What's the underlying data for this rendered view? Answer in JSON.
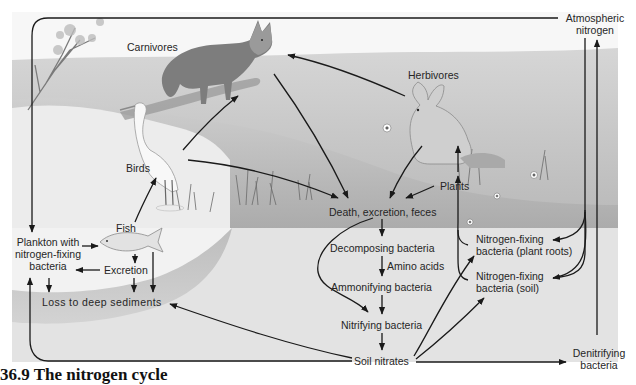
{
  "figure": {
    "caption": "36.9  The nitrogen cycle",
    "colors": {
      "upper_land": "#c9c9c9",
      "lower_land": "#bdbdbd",
      "water": "#eeeeee",
      "soil": "#e2e2e2",
      "sediment": "#c4c4c4",
      "arrow": "#1a1a1a",
      "text": "#262626"
    }
  },
  "labels": {
    "atmospheric_nitrogen": [
      "Atmospheric",
      "nitrogen"
    ],
    "carnivores": "Carnivores",
    "herbivores": "Herbivores",
    "birds": "Birds",
    "fish": "Fish",
    "plants": "Plants",
    "plankton": [
      "Plankton with",
      "nitrogen-fixing",
      "bacteria"
    ],
    "excretion": "Excretion",
    "loss_to_sediments": "Loss to deep sediments",
    "death_excretion_feces": "Death, excretion, feces",
    "decomposing_bacteria": "Decomposing bacteria",
    "amino_acids": "Amino acids",
    "ammonifying_bacteria": "Ammonifying bacteria",
    "nitrifying_bacteria": "Nitrifying bacteria",
    "soil_nitrates": "Soil nitrates",
    "nfix_plant_roots": [
      "Nitrogen-fixing",
      "bacteria (plant roots)"
    ],
    "nfix_soil": [
      "Nitrogen-fixing",
      "bacteria (soil)"
    ],
    "denitrifying_bacteria": [
      "Denitrifying",
      "bacteria"
    ]
  },
  "illustrations": [
    {
      "name": "fox",
      "represents": "Carnivores"
    },
    {
      "name": "rabbit",
      "represents": "Herbivores"
    },
    {
      "name": "egret",
      "represents": "Birds"
    },
    {
      "name": "fish",
      "represents": "Fish"
    },
    {
      "name": "tree",
      "represents": "Plants"
    }
  ],
  "flows": [
    {
      "from": "Atmospheric nitrogen",
      "to": "Plankton with nitrogen-fixing bacteria"
    },
    {
      "from": "Atmospheric nitrogen",
      "to": "Nitrogen-fixing bacteria (plant roots)"
    },
    {
      "from": "Atmospheric nitrogen",
      "to": "Nitrogen-fixing bacteria (soil)"
    },
    {
      "from": "Denitrifying bacteria",
      "to": "Atmospheric nitrogen"
    },
    {
      "from": "Herbivores",
      "to": "Carnivores"
    },
    {
      "from": "Birds",
      "to": "Carnivores"
    },
    {
      "from": "Fish",
      "to": "Birds"
    },
    {
      "from": "Plankton with nitrogen-fixing bacteria",
      "to": "Fish"
    },
    {
      "from": "Fish",
      "to": "Excretion"
    },
    {
      "from": "Excretion",
      "to": "Plankton with nitrogen-fixing bacteria"
    },
    {
      "from": "Excretion",
      "to": "Loss to deep sediments"
    },
    {
      "from": "Fish",
      "to": "Loss to deep sediments"
    },
    {
      "from": "Plankton with nitrogen-fixing bacteria",
      "to": "Loss to deep sediments"
    },
    {
      "from": "Carnivores",
      "to": "Death, excretion, feces"
    },
    {
      "from": "Birds",
      "to": "Death, excretion, feces"
    },
    {
      "from": "Herbivores",
      "to": "Death, excretion, feces"
    },
    {
      "from": "Plants",
      "to": "Death, excretion, feces"
    },
    {
      "from": "Plants",
      "to": "Herbivores"
    },
    {
      "from": "Death, excretion, feces",
      "to": "Decomposing bacteria"
    },
    {
      "from": "Decomposing bacteria",
      "to": "Ammonifying bacteria",
      "via": "Amino acids"
    },
    {
      "from": "Ammonifying bacteria",
      "to": "Nitrifying bacteria"
    },
    {
      "from": "Death, excretion, feces",
      "to": "Nitrifying bacteria"
    },
    {
      "from": "Nitrifying bacteria",
      "to": "Soil nitrates"
    },
    {
      "from": "Soil nitrates",
      "to": "Nitrogen-fixing bacteria (plant roots)"
    },
    {
      "from": "Soil nitrates",
      "to": "Nitrogen-fixing bacteria (soil)"
    },
    {
      "from": "Soil nitrates",
      "to": "Denitrifying bacteria"
    },
    {
      "from": "Soil nitrates",
      "to": "Loss to deep sediments"
    },
    {
      "from": "Soil nitrates",
      "to": "Plankton with nitrogen-fixing bacteria"
    },
    {
      "from": "Nitrogen-fixing bacteria (plant roots)",
      "to": "Plants"
    },
    {
      "from": "Nitrogen-fixing bacteria (soil)",
      "to": "Plants"
    }
  ]
}
